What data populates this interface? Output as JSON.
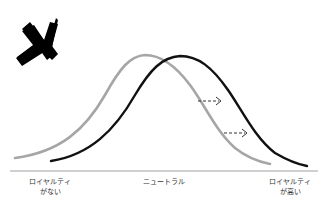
{
  "diagram": {
    "mark": {
      "icon": "x-mark-icon",
      "color": "#000000"
    },
    "curves": [
      {
        "name": "before",
        "color": "#a6a6a6",
        "description": "distribution before shift"
      },
      {
        "name": "after",
        "color": "#111111",
        "description": "distribution shifted toward higher loyalty"
      }
    ],
    "arrows": [
      {
        "icon": "dashed-arrow-right-icon",
        "color": "#333333"
      },
      {
        "icon": "dashed-arrow-right-icon",
        "color": "#333333"
      }
    ],
    "axis": {
      "color": "#888888",
      "labels": {
        "left_line1": "ロイヤルティ",
        "left_line2": "がない",
        "middle": "ニュートラル",
        "right_line1": "ロイヤルティ",
        "right_line2": "が高い"
      }
    }
  }
}
